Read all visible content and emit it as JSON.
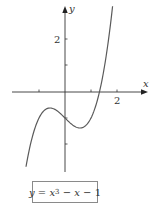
{
  "chart_data": {
    "type": "line",
    "title": "",
    "function": "y = x^3 - x - 1",
    "xlabel": "x",
    "ylabel": "y",
    "x_tick_labels": [
      {
        "value": 2,
        "label": "2"
      }
    ],
    "y_tick_labels": [
      {
        "value": 2,
        "label": "2"
      }
    ],
    "x_ticks": [
      -1,
      1,
      2
    ],
    "y_ticks": [
      -2,
      -1,
      1,
      2
    ],
    "xlim": [
      -2.0,
      3.1
    ],
    "ylim": [
      -3.1,
      3.4
    ],
    "domain": [
      -1.5,
      1.83
    ],
    "grid": false,
    "legend": {
      "text": "y = x³ − x − 1",
      "position": "bottom-center boxed"
    },
    "series": [
      {
        "name": "y = x^3 - x - 1",
        "x": [
          -1.5,
          -1.25,
          -1.0,
          -0.75,
          -0.577,
          -0.25,
          0.0,
          0.25,
          0.577,
          0.75,
          1.0,
          1.25,
          1.5,
          1.83
        ],
        "y": [
          -2.875,
          -1.703,
          -1.0,
          -0.672,
          -0.615,
          -0.766,
          -1.0,
          -1.234,
          -1.385,
          -1.328,
          -1.0,
          -0.297,
          0.875,
          3.298
        ]
      }
    ],
    "colors": {
      "curve": "#5a5a5a",
      "axes": "#333333",
      "box_border": "#8a8a8a"
    }
  },
  "labels": {
    "x_axis": "x",
    "y_axis": "y",
    "x_tick_2": "2",
    "y_tick_2": "2"
  },
  "equation": {
    "y": "y",
    "eq1": " = ",
    "x1": "x",
    "exp": "3",
    "minus1": " − ",
    "x2": "x",
    "rest": " − 1"
  }
}
